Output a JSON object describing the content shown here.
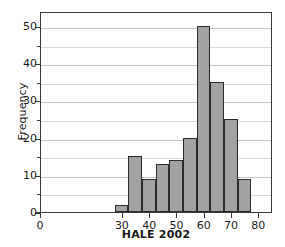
{
  "chart_data": {
    "type": "bar",
    "chart_subtype": "histogram",
    "title": "",
    "xlabel": "HALE 2002",
    "ylabel": "Frequency",
    "xlim": [
      0,
      85
    ],
    "ylim": [
      0,
      54
    ],
    "grid": true,
    "legend": null,
    "bin_width": 5,
    "bin_starts": [
      27,
      32,
      37,
      42,
      47,
      52,
      57,
      62,
      67,
      72
    ],
    "bin_ends": [
      32,
      37,
      42,
      47,
      52,
      57,
      62,
      67,
      72,
      77
    ],
    "categories": [
      "27-32",
      "32-37",
      "37-42",
      "42-47",
      "47-52",
      "52-57",
      "57-62",
      "62-67",
      "67-72",
      "72-77"
    ],
    "values": [
      2,
      15,
      9,
      13,
      14,
      20,
      50,
      35,
      25,
      9
    ],
    "x_ticks": [
      0,
      30,
      40,
      50,
      60,
      70,
      80
    ],
    "x_tick_labels": [
      "0",
      "30",
      "40",
      "50",
      "60",
      "70",
      "80"
    ],
    "y_ticks": [
      0,
      10,
      20,
      30,
      40,
      50
    ],
    "y_tick_labels": [
      "0",
      "10",
      "20",
      "30",
      "40",
      "50"
    ],
    "y_minor_ticks": [
      5,
      15,
      25,
      35,
      45
    ],
    "bar_color": "#a2a2a2",
    "bar_edge_color": "#2b2b2b",
    "grid_color": "#d9d9d9",
    "axis_color": "#3a3a3a",
    "background": "#ffffff"
  }
}
